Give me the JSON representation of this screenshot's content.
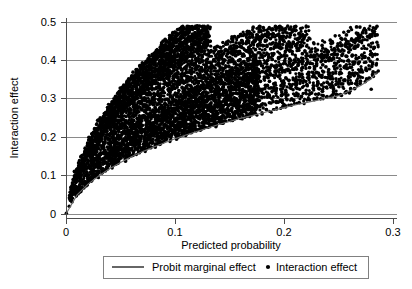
{
  "chart_data": {
    "type": "scatter",
    "title": "",
    "subtitle": "",
    "xlabel": "Predicted probability",
    "ylabel": "Interaction effect",
    "xlim": [
      0,
      0.3
    ],
    "ylim": [
      0,
      0.5
    ],
    "xticks": [
      0,
      0.1,
      0.2,
      0.3
    ],
    "xtick_labels": [
      "0",
      "0.1",
      "0.2",
      "0.3"
    ],
    "yticks": [
      0,
      0.1,
      0.2,
      0.3,
      0.4,
      0.5
    ],
    "ytick_labels": [
      "0",
      "0.1",
      "0.2",
      "0.3",
      "0.4",
      "0.5"
    ],
    "grid": "horizontal",
    "legend_position": "below-axes",
    "legend": [
      {
        "label": "Probit marginal effect",
        "marker": "line"
      },
      {
        "label": "Interaction effect",
        "marker": "dot"
      }
    ],
    "series": [
      {
        "name": "Probit marginal effect",
        "type": "line",
        "x": [
          0.0,
          0.01,
          0.02,
          0.03,
          0.04,
          0.05,
          0.06,
          0.07,
          0.08,
          0.09,
          0.1,
          0.11,
          0.12,
          0.13,
          0.14,
          0.15,
          0.16,
          0.17,
          0.18,
          0.19,
          0.2,
          0.21,
          0.22,
          0.23,
          0.24,
          0.25,
          0.26,
          0.27,
          0.28,
          0.285
        ],
        "y": [
          0.0,
          0.049,
          0.077,
          0.099,
          0.118,
          0.134,
          0.149,
          0.162,
          0.174,
          0.185,
          0.196,
          0.206,
          0.215,
          0.224,
          0.233,
          0.241,
          0.249,
          0.256,
          0.263,
          0.27,
          0.277,
          0.284,
          0.29,
          0.296,
          0.302,
          0.308,
          0.32,
          0.334,
          0.352,
          0.368
        ]
      },
      {
        "name": "Interaction effect",
        "type": "scatter",
        "marker": "filled-circle",
        "marker_color": "#000000",
        "n_points": 2600,
        "description": "Dense fan-shaped cloud of points emanating from the origin; lower envelope follows the probit marginal effect curve, upper envelope rises steeply with a wide spread of radial streaks reaching about 0.47 near x=0.11 and about 0.48 near x=0.285.",
        "x_range": [
          0.0,
          0.285
        ],
        "y_range": [
          0.0,
          0.48
        ],
        "sample_points": [
          [
            0.003,
            0.02
          ],
          [
            0.004,
            0.035
          ],
          [
            0.005,
            0.05
          ],
          [
            0.006,
            0.062
          ],
          [
            0.008,
            0.075
          ],
          [
            0.01,
            0.09
          ],
          [
            0.012,
            0.105
          ],
          [
            0.014,
            0.12
          ],
          [
            0.016,
            0.132
          ],
          [
            0.018,
            0.145
          ],
          [
            0.02,
            0.155
          ],
          [
            0.022,
            0.168
          ],
          [
            0.025,
            0.18
          ],
          [
            0.028,
            0.192
          ],
          [
            0.03,
            0.2
          ],
          [
            0.033,
            0.215
          ],
          [
            0.036,
            0.228
          ],
          [
            0.04,
            0.24
          ],
          [
            0.045,
            0.255
          ],
          [
            0.05,
            0.268
          ],
          [
            0.055,
            0.28
          ],
          [
            0.06,
            0.292
          ],
          [
            0.065,
            0.3
          ],
          [
            0.07,
            0.315
          ],
          [
            0.075,
            0.325
          ],
          [
            0.08,
            0.34
          ],
          [
            0.085,
            0.352
          ],
          [
            0.09,
            0.36
          ],
          [
            0.095,
            0.372
          ],
          [
            0.1,
            0.385
          ],
          [
            0.105,
            0.4
          ],
          [
            0.11,
            0.455
          ],
          [
            0.095,
            0.465
          ],
          [
            0.1,
            0.462
          ],
          [
            0.105,
            0.458
          ],
          [
            0.118,
            0.44
          ],
          [
            0.125,
            0.425
          ],
          [
            0.14,
            0.4
          ],
          [
            0.155,
            0.395
          ],
          [
            0.17,
            0.39
          ],
          [
            0.185,
            0.4
          ],
          [
            0.195,
            0.405
          ],
          [
            0.21,
            0.4
          ],
          [
            0.225,
            0.41
          ],
          [
            0.24,
            0.415
          ],
          [
            0.255,
            0.425
          ],
          [
            0.268,
            0.44
          ],
          [
            0.283,
            0.475
          ],
          [
            0.06,
            0.23
          ],
          [
            0.08,
            0.255
          ],
          [
            0.1,
            0.275
          ],
          [
            0.12,
            0.29
          ],
          [
            0.14,
            0.305
          ],
          [
            0.16,
            0.315
          ],
          [
            0.18,
            0.325
          ],
          [
            0.2,
            0.335
          ],
          [
            0.22,
            0.345
          ],
          [
            0.24,
            0.355
          ],
          [
            0.26,
            0.365
          ],
          [
            0.275,
            0.375
          ],
          [
            0.05,
            0.175
          ],
          [
            0.08,
            0.205
          ],
          [
            0.11,
            0.23
          ],
          [
            0.14,
            0.25
          ],
          [
            0.17,
            0.27
          ],
          [
            0.2,
            0.285
          ],
          [
            0.23,
            0.3
          ],
          [
            0.26,
            0.315
          ],
          [
            0.28,
            0.325
          ]
        ]
      }
    ]
  },
  "axes": {
    "ylabel": "Interaction effect",
    "xlabel": "Predicted probability",
    "xtick_labels": [
      "0",
      "0.1",
      "0.2",
      "0.3"
    ],
    "ytick_labels": [
      "0",
      "0.1",
      "0.2",
      "0.3",
      "0.4",
      "0.5"
    ]
  },
  "legend": {
    "line_label": "Probit marginal effect",
    "dot_label": "Interaction effect"
  },
  "colors": {
    "point": "#000000",
    "curve": "#6b6b6b",
    "grid": "#8a8a8a",
    "axis": "#4d4d4d",
    "background": "#ffffff"
  }
}
